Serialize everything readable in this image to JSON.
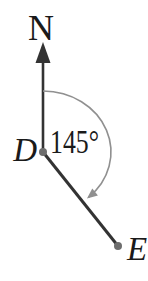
{
  "diagram": {
    "north_label": "N",
    "point_d_label": "D",
    "point_e_label": "E",
    "angle_label": "145°",
    "colors": {
      "background": "#ffffff",
      "line": "#333333",
      "arc": "#909090",
      "dot": "#6e6e6e",
      "text": "#1a1a1a"
    }
  }
}
